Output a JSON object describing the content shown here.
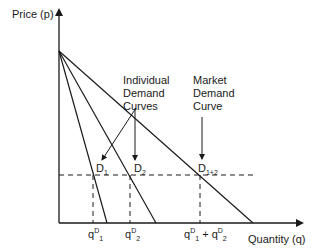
{
  "diagram": {
    "type": "economics-demand-diagram",
    "axes": {
      "y_label": "Price (p)",
      "x_label": "Quantity (q)"
    },
    "annotations": {
      "individual_line1": "Individual",
      "individual_line2": "Demand",
      "individual_line3": "Curves",
      "market_line1": "Market",
      "market_line2": "Demand",
      "market_line3": "Curve"
    },
    "curves": [
      {
        "name": "D",
        "sub": "1",
        "x_intercept_px": 107
      },
      {
        "name": "D",
        "sub": "2",
        "x_intercept_px": 156
      },
      {
        "name": "D",
        "sub": "1+2",
        "x_intercept_px": 253
      }
    ],
    "quantity_labels": {
      "q1_base": "q",
      "q1_sup": "D",
      "q1_sub": "1",
      "q2_base": "q",
      "q2_sup": "D",
      "q2_sub": "2",
      "sum_a_base": "q",
      "sum_a_sup": "D",
      "sum_a_sub": "1",
      "sum_plus": " + ",
      "sum_b_base": "q",
      "sum_b_sup": "D",
      "sum_b_sub": "2"
    },
    "colors": {
      "line": "#1a1a1a",
      "background": "#ffffff"
    }
  }
}
